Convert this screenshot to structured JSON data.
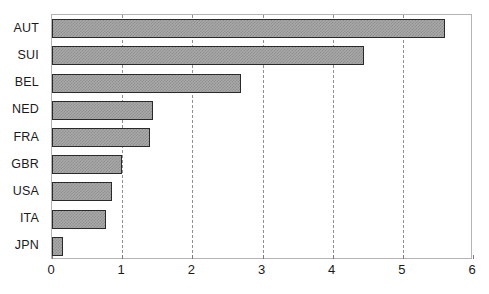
{
  "chart_data": {
    "type": "bar",
    "orientation": "horizontal",
    "title": "",
    "xlabel": "",
    "ylabel": "",
    "xlim": [
      0,
      6
    ],
    "xticks": [
      "0",
      "1",
      "2",
      "3",
      "4",
      "5",
      "6"
    ],
    "xtick_values": [
      0,
      1,
      2,
      3,
      4,
      5,
      6
    ],
    "grid": "vertical-dashed",
    "legend": "none",
    "categories": [
      "AUT",
      "SUI",
      "BEL",
      "NED",
      "FRA",
      "GBR",
      "USA",
      "ITA",
      "JPN"
    ],
    "values": [
      5.6,
      4.45,
      2.7,
      1.44,
      1.39,
      1.0,
      0.86,
      0.77,
      0.16
    ],
    "bars": [
      {
        "label": "AUT",
        "value": 5.6
      },
      {
        "label": "SUI",
        "value": 4.45
      },
      {
        "label": "BEL",
        "value": 2.7
      },
      {
        "label": "NED",
        "value": 1.44
      },
      {
        "label": "FRA",
        "value": 1.39
      },
      {
        "label": "GBR",
        "value": 1.0
      },
      {
        "label": "USA",
        "value": 0.86
      },
      {
        "label": "ITA",
        "value": 0.77
      },
      {
        "label": "JPN",
        "value": 0.16
      }
    ],
    "colors": {
      "bar_fill": "#a9a9a9",
      "bar_hatch": "#8f8f8f",
      "bar_border": "#2a2a2a",
      "gridline": "#909090",
      "frame": "#b4b4b4",
      "text": "#1a1a1a",
      "background": "#ffffff"
    }
  }
}
